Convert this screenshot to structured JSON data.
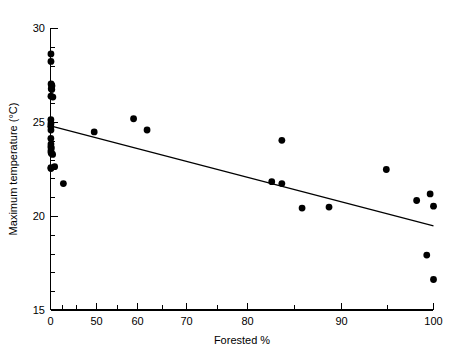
{
  "chart_data": {
    "type": "scatter",
    "title": "",
    "subtitle": "",
    "xlabel": "Forested %",
    "ylabel": "Maximum temperature (°C)",
    "xlim": [
      0,
      100
    ],
    "ylim": [
      15,
      30
    ],
    "grid": false,
    "legend": null,
    "x_ticks_major": [
      0,
      50,
      60,
      70,
      80,
      90,
      100
    ],
    "x_tick_labels": [
      "0",
      "50",
      "60",
      "70",
      "80",
      "90",
      "100"
    ],
    "x_ticks_minor": [
      10,
      20,
      30,
      40,
      55,
      65,
      75,
      85,
      95
    ],
    "y_ticks_major": [
      15,
      20,
      25,
      30
    ],
    "y_tick_labels": [
      "15",
      "20",
      "25",
      "30"
    ],
    "y_ticks_minor": [
      16,
      17,
      18,
      19,
      21,
      22,
      23,
      24,
      26,
      27,
      28,
      29
    ],
    "x_axis_note": "0 to 50 region is compressed relative to 50-100",
    "marker": {
      "shape": "circle",
      "color": "#000000",
      "size_px": 3.4
    },
    "points": [
      {
        "x": 0.5,
        "y": 28.65
      },
      {
        "x": 0.5,
        "y": 28.25
      },
      {
        "x": 0.6,
        "y": 27.05
      },
      {
        "x": 1.2,
        "y": 27.0
      },
      {
        "x": 1.6,
        "y": 26.95
      },
      {
        "x": 0.8,
        "y": 26.8
      },
      {
        "x": 1.4,
        "y": 26.75
      },
      {
        "x": 0.5,
        "y": 26.4
      },
      {
        "x": 2.6,
        "y": 26.35
      },
      {
        "x": 0.4,
        "y": 25.15
      },
      {
        "x": 0.5,
        "y": 24.95
      },
      {
        "x": 0.3,
        "y": 24.8
      },
      {
        "x": 0.5,
        "y": 24.6
      },
      {
        "x": 0.4,
        "y": 24.15
      },
      {
        "x": 0.5,
        "y": 23.85
      },
      {
        "x": 0.4,
        "y": 23.7
      },
      {
        "x": 0.9,
        "y": 23.65
      },
      {
        "x": 0.5,
        "y": 23.5
      },
      {
        "x": 0.6,
        "y": 23.4
      },
      {
        "x": 1.0,
        "y": 23.35
      },
      {
        "x": 2.3,
        "y": 23.3
      },
      {
        "x": 0.4,
        "y": 22.6
      },
      {
        "x": 0.5,
        "y": 22.55
      },
      {
        "x": 4.5,
        "y": 22.65
      },
      {
        "x": 14.0,
        "y": 21.75
      },
      {
        "x": 47.5,
        "y": 24.5
      },
      {
        "x": 55.5,
        "y": 25.2
      },
      {
        "x": 57.5,
        "y": 24.6
      },
      {
        "x": 77.5,
        "y": 24.05
      },
      {
        "x": 76.0,
        "y": 21.85
      },
      {
        "x": 77.5,
        "y": 21.75
      },
      {
        "x": 80.5,
        "y": 20.45
      },
      {
        "x": 84.5,
        "y": 20.5
      },
      {
        "x": 93.0,
        "y": 22.5
      },
      {
        "x": 97.5,
        "y": 20.85
      },
      {
        "x": 99.5,
        "y": 21.2
      },
      {
        "x": 100.0,
        "y": 20.55
      },
      {
        "x": 99.0,
        "y": 17.95
      },
      {
        "x": 100.0,
        "y": 16.65
      }
    ],
    "trendline": {
      "type": "linear-fit",
      "x_start": 0,
      "y_start": 24.82,
      "x_end": 100,
      "y_end": 19.5,
      "color": "#000000"
    }
  }
}
